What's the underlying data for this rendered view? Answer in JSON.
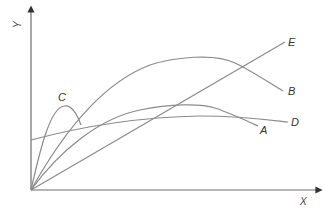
{
  "diagram": {
    "axes": {
      "x_label": "X",
      "y_label": "Y"
    },
    "curves": [
      {
        "id": "A",
        "label": "A",
        "description": "rises from origin to moderate peak, then declines"
      },
      {
        "id": "B",
        "label": "B",
        "description": "rises from origin to highest peak, then declines"
      },
      {
        "id": "C",
        "label": "C",
        "description": "sharp early peak near origin, quickly falls"
      },
      {
        "id": "D",
        "label": "D",
        "description": "starts above origin on Y axis, nearly flat slow rise"
      },
      {
        "id": "E",
        "label": "E",
        "description": "straight line from origin rising steadily"
      }
    ],
    "colors": {
      "axis": "#6e6e6e",
      "curve": "#8a8a8a",
      "label": "#333333"
    }
  }
}
